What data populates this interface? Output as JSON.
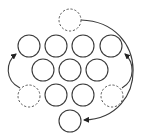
{
  "diagram": {
    "title": "",
    "colors": {
      "background": "#ffffff",
      "stroke": "#3a3a3a",
      "dashed_stroke": "#555555"
    },
    "solid_circles": [
      {
        "id": "r1c1",
        "cx": 29,
        "cy": 46,
        "r": 11
      },
      {
        "id": "r1c2",
        "cx": 56,
        "cy": 46,
        "r": 11
      },
      {
        "id": "r1c3",
        "cx": 83,
        "cy": 46,
        "r": 11
      },
      {
        "id": "r1c4",
        "cx": 111,
        "cy": 46,
        "r": 11
      },
      {
        "id": "r2c1",
        "cx": 43,
        "cy": 70,
        "r": 11
      },
      {
        "id": "r2c2",
        "cx": 70,
        "cy": 70,
        "r": 11
      },
      {
        "id": "r2c3",
        "cx": 97,
        "cy": 70,
        "r": 11
      },
      {
        "id": "r3c1",
        "cx": 56,
        "cy": 95,
        "r": 11
      },
      {
        "id": "r3c2",
        "cx": 83,
        "cy": 95,
        "r": 11
      },
      {
        "id": "bottom",
        "cx": 70,
        "cy": 121,
        "r": 11
      }
    ],
    "dashed_circles": [
      {
        "id": "top-origin",
        "cx": 70,
        "cy": 20,
        "r": 11
      },
      {
        "id": "left-origin",
        "cx": 29,
        "cy": 96,
        "r": 11
      },
      {
        "id": "right-origin",
        "cx": 112,
        "cy": 96,
        "r": 11
      }
    ],
    "arrows": [
      {
        "id": "top-to-bottom",
        "from": "top-origin",
        "to": "bottom",
        "path": "M81,20 C150,22 150,118 84,120"
      },
      {
        "id": "left-to-topleft",
        "from": "left-origin",
        "to": "r1c1",
        "path": "M20,88 C4,80 6,62 16,54"
      },
      {
        "id": "right-to-topright",
        "from": "right-origin",
        "to": "r1c4",
        "path": "M122,88 C136,80 134,62 125,54"
      }
    ]
  }
}
